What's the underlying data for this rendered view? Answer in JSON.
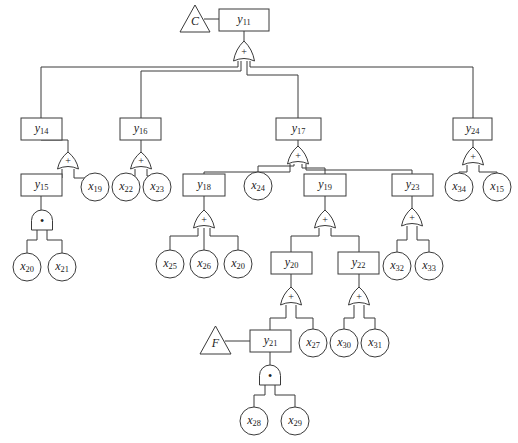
{
  "diagram": {
    "type": "fault-tree",
    "line_color": "#3a3a3a",
    "events": [
      {
        "id": "y11",
        "base": "y",
        "sub": "11",
        "x": 219,
        "y": 9,
        "w": 50,
        "h": 22
      },
      {
        "id": "y14",
        "base": "y",
        "sub": "14",
        "x": 21,
        "y": 118,
        "w": 41,
        "h": 22
      },
      {
        "id": "y16",
        "base": "y",
        "sub": "16",
        "x": 120,
        "y": 118,
        "w": 41,
        "h": 22
      },
      {
        "id": "y17",
        "base": "y",
        "sub": "17",
        "x": 276,
        "y": 118,
        "w": 45,
        "h": 22
      },
      {
        "id": "y24",
        "base": "y",
        "sub": "24",
        "x": 453,
        "y": 118,
        "w": 39,
        "h": 22
      },
      {
        "id": "y15",
        "base": "y",
        "sub": "15",
        "x": 21,
        "y": 174,
        "w": 41,
        "h": 22
      },
      {
        "id": "y18",
        "base": "y",
        "sub": "18",
        "x": 183,
        "y": 174,
        "w": 42,
        "h": 22
      },
      {
        "id": "y19",
        "base": "y",
        "sub": "19",
        "x": 304,
        "y": 174,
        "w": 42,
        "h": 22
      },
      {
        "id": "y23",
        "base": "y",
        "sub": "23",
        "x": 392,
        "y": 174,
        "w": 41,
        "h": 22
      },
      {
        "id": "y20",
        "base": "y",
        "sub": "20",
        "x": 271,
        "y": 252,
        "w": 41,
        "h": 22
      },
      {
        "id": "y22",
        "base": "y",
        "sub": "22",
        "x": 338,
        "y": 252,
        "w": 41,
        "h": 22
      },
      {
        "id": "y21",
        "base": "y",
        "sub": "21",
        "x": 250,
        "y": 330,
        "w": 41,
        "h": 22
      }
    ],
    "basic_events": [
      {
        "id": "x19",
        "base": "x",
        "sub": "19",
        "cx": 95,
        "cy": 187,
        "r": 14
      },
      {
        "id": "x22",
        "base": "x",
        "sub": "22",
        "cx": 126,
        "cy": 187,
        "r": 14
      },
      {
        "id": "x23",
        "base": "x",
        "sub": "23",
        "cx": 157,
        "cy": 187,
        "r": 14
      },
      {
        "id": "x20a",
        "base": "x",
        "sub": "20",
        "cx": 27,
        "cy": 267,
        "r": 14
      },
      {
        "id": "x21",
        "base": "x",
        "sub": "21",
        "cx": 62,
        "cy": 267,
        "r": 14
      },
      {
        "id": "x24",
        "base": "x",
        "sub": "24",
        "cx": 258,
        "cy": 186,
        "r": 14
      },
      {
        "id": "x25",
        "base": "x",
        "sub": "25",
        "cx": 170,
        "cy": 264,
        "r": 14
      },
      {
        "id": "x26",
        "base": "x",
        "sub": "26",
        "cx": 204,
        "cy": 264,
        "r": 14
      },
      {
        "id": "x20b",
        "base": "x",
        "sub": "20",
        "cx": 238,
        "cy": 264,
        "r": 14
      },
      {
        "id": "x32",
        "base": "x",
        "sub": "32",
        "cx": 397,
        "cy": 266,
        "r": 14
      },
      {
        "id": "x33",
        "base": "x",
        "sub": "33",
        "cx": 429,
        "cy": 266,
        "r": 14
      },
      {
        "id": "x34",
        "base": "x",
        "sub": "34",
        "cx": 459,
        "cy": 187,
        "r": 14
      },
      {
        "id": "x15",
        "base": "x",
        "sub": "15",
        "cx": 497,
        "cy": 187,
        "r": 14
      },
      {
        "id": "x27",
        "base": "x",
        "sub": "27",
        "cx": 313,
        "cy": 343,
        "r": 14
      },
      {
        "id": "x30",
        "base": "x",
        "sub": "30",
        "cx": 344,
        "cy": 343,
        "r": 14
      },
      {
        "id": "x31",
        "base": "x",
        "sub": "31",
        "cx": 375,
        "cy": 343,
        "r": 14
      },
      {
        "id": "x28",
        "base": "x",
        "sub": "28",
        "cx": 254,
        "cy": 421,
        "r": 14
      },
      {
        "id": "x29",
        "base": "x",
        "sub": "29",
        "cx": 295,
        "cy": 421,
        "r": 14
      }
    ],
    "transfers": [
      {
        "id": "C",
        "label": "C",
        "x": 180,
        "y": 5,
        "w": 30,
        "h": 27,
        "link_to_x": 219,
        "link_y": 19
      },
      {
        "id": "F",
        "label": "F",
        "x": 200,
        "y": 326,
        "w": 31,
        "h": 28,
        "link_to_x": 250,
        "link_y": 341
      }
    ],
    "gates": [
      {
        "id": "g11",
        "kind": "or",
        "symbol": "+",
        "cx": 244,
        "top": 41,
        "w": 21,
        "h": 20
      },
      {
        "id": "g14",
        "kind": "or",
        "symbol": "+",
        "cx": 68,
        "top": 152,
        "w": 21,
        "h": 17
      },
      {
        "id": "g16",
        "kind": "or",
        "symbol": "+",
        "cx": 141,
        "top": 152,
        "w": 21,
        "h": 17
      },
      {
        "id": "g17",
        "kind": "or",
        "symbol": "+",
        "cx": 298,
        "top": 146,
        "w": 21,
        "h": 18
      },
      {
        "id": "g24",
        "kind": "or",
        "symbol": "+",
        "cx": 473,
        "top": 147,
        "w": 21,
        "h": 18
      },
      {
        "id": "g15",
        "kind": "and",
        "symbol": "•",
        "cx": 42,
        "top": 210,
        "w": 21,
        "h": 20
      },
      {
        "id": "g18",
        "kind": "or",
        "symbol": "+",
        "cx": 204,
        "top": 210,
        "w": 21,
        "h": 18
      },
      {
        "id": "g19",
        "kind": "or",
        "symbol": "+",
        "cx": 325,
        "top": 210,
        "w": 21,
        "h": 18
      },
      {
        "id": "g23",
        "kind": "or",
        "symbol": "+",
        "cx": 412,
        "top": 208,
        "w": 21,
        "h": 18
      },
      {
        "id": "g20",
        "kind": "or",
        "symbol": "+",
        "cx": 291,
        "top": 287,
        "w": 21,
        "h": 18
      },
      {
        "id": "g22",
        "kind": "or",
        "symbol": "+",
        "cx": 359,
        "top": 287,
        "w": 21,
        "h": 18
      },
      {
        "id": "g21",
        "kind": "and",
        "symbol": "•",
        "cx": 270,
        "top": 365,
        "w": 21,
        "h": 20
      }
    ],
    "lines": [
      [
        244,
        31,
        244,
        41
      ],
      [
        238,
        61,
        238,
        67,
        41,
        67,
        41,
        118
      ],
      [
        241,
        61,
        241,
        71,
        141,
        71,
        141,
        118
      ],
      [
        247,
        61,
        247,
        75,
        298,
        75,
        298,
        118
      ],
      [
        250,
        61,
        250,
        67,
        473,
        67,
        473,
        118
      ],
      [
        41,
        140,
        68,
        140
      ],
      [
        68,
        140,
        68,
        152
      ],
      [
        62,
        169,
        62,
        178
      ],
      [
        41,
        178,
        62,
        178
      ],
      [
        41,
        178,
        41,
        174
      ],
      [
        74,
        169,
        74,
        178,
        95,
        178,
        95,
        173
      ],
      [
        141,
        140,
        141,
        152
      ],
      [
        135,
        169,
        135,
        176,
        126,
        176,
        126,
        173
      ],
      [
        147,
        169,
        147,
        176,
        157,
        176,
        157,
        173
      ],
      [
        298,
        140,
        298,
        146
      ],
      [
        290,
        164,
        290,
        172,
        204,
        172,
        204,
        174
      ],
      [
        294,
        164,
        294,
        166,
        258,
        166,
        258,
        172
      ],
      [
        302,
        164,
        302,
        168,
        325,
        168,
        325,
        174
      ],
      [
        306,
        164,
        306,
        170,
        412,
        170,
        412,
        174
      ],
      [
        473,
        140,
        473,
        147
      ],
      [
        467,
        165,
        467,
        172,
        459,
        172,
        459,
        173
      ],
      [
        479,
        165,
        479,
        172,
        497,
        172,
        497,
        173
      ],
      [
        41,
        196,
        41,
        210
      ],
      [
        37,
        230,
        37,
        240,
        27,
        240,
        27,
        253
      ],
      [
        47,
        230,
        47,
        240,
        62,
        240,
        62,
        253
      ],
      [
        204,
        196,
        204,
        210
      ],
      [
        198,
        228,
        198,
        236,
        170,
        236,
        170,
        250
      ],
      [
        204,
        228,
        204,
        250
      ],
      [
        210,
        228,
        210,
        236,
        238,
        236,
        238,
        250
      ],
      [
        325,
        196,
        325,
        210
      ],
      [
        319,
        228,
        319,
        236,
        291,
        236,
        291,
        252
      ],
      [
        331,
        228,
        331,
        236,
        359,
        236,
        359,
        252
      ],
      [
        412,
        196,
        412,
        208
      ],
      [
        407,
        226,
        407,
        240,
        397,
        240,
        397,
        252
      ],
      [
        417,
        226,
        417,
        240,
        429,
        240,
        429,
        252
      ],
      [
        291,
        274,
        291,
        287
      ],
      [
        286,
        305,
        286,
        318,
        270,
        318,
        270,
        330
      ],
      [
        296,
        305,
        296,
        318,
        313,
        318,
        313,
        329
      ],
      [
        359,
        274,
        359,
        287
      ],
      [
        354,
        305,
        354,
        318,
        344,
        318,
        344,
        329
      ],
      [
        364,
        305,
        364,
        318,
        375,
        318,
        375,
        329
      ],
      [
        270,
        352,
        270,
        365
      ],
      [
        265,
        385,
        265,
        395,
        254,
        395,
        254,
        407
      ],
      [
        275,
        385,
        275,
        395,
        295,
        395,
        295,
        407
      ]
    ]
  },
  "caption": ""
}
